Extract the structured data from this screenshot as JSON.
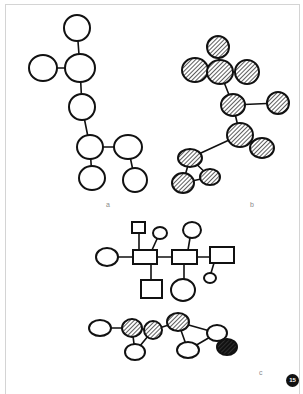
{
  "figure": {
    "panels": [
      {
        "id": "a",
        "label": "a",
        "style": "open"
      },
      {
        "id": "b",
        "label": "b",
        "style": "hatched"
      },
      {
        "id": "c",
        "label": "c",
        "style": "mixed"
      }
    ],
    "badge": "15",
    "colors": {
      "stroke": "#111111",
      "hatch_bg": "#555555",
      "frame": "#d4d4d4",
      "label": "#8a8a8a"
    }
  },
  "diagram_a": {
    "nodes": [
      {
        "id": "a1",
        "shape": "circle",
        "cx": 77,
        "cy": 28,
        "rx": 13,
        "ry": 13,
        "fill": "open"
      },
      {
        "id": "a2",
        "shape": "circle",
        "cx": 43,
        "cy": 68,
        "rx": 14,
        "ry": 13,
        "fill": "open"
      },
      {
        "id": "a3",
        "shape": "circle",
        "cx": 80,
        "cy": 68,
        "rx": 15,
        "ry": 14,
        "fill": "open"
      },
      {
        "id": "a4",
        "shape": "circle",
        "cx": 82,
        "cy": 107,
        "rx": 13,
        "ry": 13,
        "fill": "open"
      },
      {
        "id": "a5",
        "shape": "circle",
        "cx": 90,
        "cy": 147,
        "rx": 13,
        "ry": 12,
        "fill": "open"
      },
      {
        "id": "a6",
        "shape": "circle",
        "cx": 128,
        "cy": 147,
        "rx": 14,
        "ry": 12,
        "fill": "open"
      },
      {
        "id": "a7",
        "shape": "circle",
        "cx": 92,
        "cy": 178,
        "rx": 13,
        "ry": 12,
        "fill": "open"
      },
      {
        "id": "a8",
        "shape": "circle",
        "cx": 135,
        "cy": 180,
        "rx": 12,
        "ry": 12,
        "fill": "open"
      }
    ],
    "edges": [
      [
        "a1",
        "a3"
      ],
      [
        "a2",
        "a3"
      ],
      [
        "a3",
        "a4"
      ],
      [
        "a4",
        "a5"
      ],
      [
        "a5",
        "a6"
      ],
      [
        "a5",
        "a7"
      ],
      [
        "a6",
        "a8"
      ]
    ]
  },
  "diagram_b": {
    "nodes": [
      {
        "id": "b1",
        "shape": "circle",
        "cx": 218,
        "cy": 47,
        "rx": 11,
        "ry": 11,
        "fill": "hatched"
      },
      {
        "id": "b2",
        "shape": "circle",
        "cx": 195,
        "cy": 70,
        "rx": 13,
        "ry": 12,
        "fill": "hatched"
      },
      {
        "id": "b3",
        "shape": "circle",
        "cx": 220,
        "cy": 72,
        "rx": 13,
        "ry": 12,
        "fill": "hatched"
      },
      {
        "id": "b4",
        "shape": "circle",
        "cx": 247,
        "cy": 72,
        "rx": 12,
        "ry": 12,
        "fill": "hatched"
      },
      {
        "id": "b5",
        "shape": "circle",
        "cx": 233,
        "cy": 105,
        "rx": 12,
        "ry": 11,
        "fill": "hatched"
      },
      {
        "id": "b6",
        "shape": "circle",
        "cx": 278,
        "cy": 103,
        "rx": 11,
        "ry": 11,
        "fill": "hatched"
      },
      {
        "id": "b7",
        "shape": "circle",
        "cx": 240,
        "cy": 135,
        "rx": 13,
        "ry": 12,
        "fill": "hatched"
      },
      {
        "id": "b8",
        "shape": "circle",
        "cx": 262,
        "cy": 148,
        "rx": 12,
        "ry": 10,
        "fill": "hatched"
      },
      {
        "id": "b9",
        "shape": "circle",
        "cx": 190,
        "cy": 158,
        "rx": 12,
        "ry": 9,
        "fill": "hatched"
      },
      {
        "id": "b10",
        "shape": "circle",
        "cx": 210,
        "cy": 177,
        "rx": 10,
        "ry": 8,
        "fill": "hatched"
      },
      {
        "id": "b11",
        "shape": "circle",
        "cx": 183,
        "cy": 183,
        "rx": 11,
        "ry": 10,
        "fill": "hatched"
      }
    ],
    "edges": [
      [
        "b1",
        "b3"
      ],
      [
        "b2",
        "b3"
      ],
      [
        "b3",
        "b4"
      ],
      [
        "b3",
        "b5"
      ],
      [
        "b5",
        "b6"
      ],
      [
        "b5",
        "b7"
      ],
      [
        "b7",
        "b8"
      ],
      [
        "b7",
        "b9"
      ],
      [
        "b9",
        "b10"
      ],
      [
        "b9",
        "b11"
      ],
      [
        "b11",
        "b10"
      ]
    ]
  },
  "diagram_c_top": {
    "nodes": [
      {
        "id": "ct1",
        "shape": "circle",
        "cx": 107,
        "cy": 257,
        "rx": 11,
        "ry": 9,
        "fill": "open"
      },
      {
        "id": "ct2",
        "shape": "rect",
        "x": 133,
        "y": 250,
        "w": 24,
        "h": 14,
        "fill": "open"
      },
      {
        "id": "ct3",
        "shape": "rect",
        "x": 132,
        "y": 222,
        "w": 13,
        "h": 11,
        "fill": "open"
      },
      {
        "id": "ct4",
        "shape": "circle",
        "cx": 160,
        "cy": 233,
        "rx": 7,
        "ry": 6,
        "fill": "open"
      },
      {
        "id": "ct5",
        "shape": "rect",
        "x": 172,
        "y": 250,
        "w": 25,
        "h": 14,
        "fill": "open"
      },
      {
        "id": "ct6",
        "shape": "circle",
        "cx": 192,
        "cy": 230,
        "rx": 9,
        "ry": 8,
        "fill": "open"
      },
      {
        "id": "ct7",
        "shape": "rect",
        "x": 210,
        "y": 247,
        "w": 24,
        "h": 16,
        "fill": "open"
      },
      {
        "id": "ct8",
        "shape": "circle",
        "cx": 210,
        "cy": 278,
        "rx": 6,
        "ry": 5,
        "fill": "open"
      },
      {
        "id": "ct9",
        "shape": "rect",
        "x": 141,
        "y": 280,
        "w": 21,
        "h": 18,
        "fill": "open"
      },
      {
        "id": "ct10",
        "shape": "circle",
        "cx": 183,
        "cy": 290,
        "rx": 12,
        "ry": 11,
        "fill": "open"
      }
    ],
    "edges": [
      [
        118,
        257,
        133,
        257
      ],
      [
        157,
        257,
        172,
        257
      ],
      [
        197,
        257,
        210,
        257
      ],
      [
        139,
        233,
        139,
        250
      ],
      [
        157,
        239,
        152,
        250
      ],
      [
        190,
        238,
        188,
        250
      ],
      [
        214,
        263,
        211,
        273
      ],
      [
        151,
        264,
        151,
        280
      ],
      [
        184,
        264,
        184,
        279
      ]
    ]
  },
  "diagram_c_bottom": {
    "nodes": [
      {
        "id": "cb1",
        "shape": "circle",
        "cx": 100,
        "cy": 328,
        "rx": 11,
        "ry": 8,
        "fill": "open"
      },
      {
        "id": "cb2",
        "shape": "circle",
        "cx": 132,
        "cy": 328,
        "rx": 10,
        "ry": 9,
        "fill": "hatched"
      },
      {
        "id": "cb3",
        "shape": "circle",
        "cx": 153,
        "cy": 330,
        "rx": 9,
        "ry": 9,
        "fill": "hatched"
      },
      {
        "id": "cb4",
        "shape": "circle",
        "cx": 135,
        "cy": 352,
        "rx": 10,
        "ry": 8,
        "fill": "open"
      },
      {
        "id": "cb5",
        "shape": "circle",
        "cx": 178,
        "cy": 322,
        "rx": 11,
        "ry": 9,
        "fill": "hatched"
      },
      {
        "id": "cb6",
        "shape": "circle",
        "cx": 188,
        "cy": 350,
        "rx": 11,
        "ry": 8,
        "fill": "open"
      },
      {
        "id": "cb7",
        "shape": "circle",
        "cx": 217,
        "cy": 333,
        "rx": 10,
        "ry": 8,
        "fill": "open"
      },
      {
        "id": "cb8",
        "shape": "circle",
        "cx": 227,
        "cy": 347,
        "rx": 10,
        "ry": 8,
        "fill": "dark"
      }
    ],
    "edges": [
      [
        "cb1",
        "cb2"
      ],
      [
        "cb2",
        "cb3"
      ],
      [
        "cb2",
        "cb4"
      ],
      [
        "cb3",
        "cb4"
      ],
      [
        "cb3",
        "cb5"
      ],
      [
        "cb5",
        "cb6"
      ],
      [
        "cb5",
        "cb7"
      ],
      [
        "cb6",
        "cb7"
      ],
      [
        "cb7",
        "cb8"
      ]
    ]
  }
}
